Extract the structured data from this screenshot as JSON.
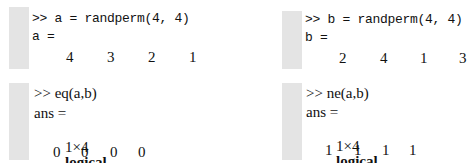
{
  "panels": {
    "a": {
      "command": ">> a = randperm(4, 4)",
      "var_label": "a =",
      "values": [
        "4",
        "3",
        "2",
        "1"
      ]
    },
    "b": {
      "command": ">> b = randperm(4, 4)",
      "var_label": "b =",
      "values": [
        "2",
        "4",
        "1",
        "3"
      ]
    },
    "eq": {
      "command": ">> eq(a,b)",
      "var_label": "ans =",
      "size": "1×4",
      "type": "logical",
      "kind": "array",
      "values": [
        "0",
        "0",
        "0",
        "0"
      ]
    },
    "ne": {
      "command": ">> ne(a,b)",
      "var_label": "ans =",
      "size": "1×4",
      "type": "logical",
      "kind": "array",
      "values": [
        "1",
        "1",
        "1",
        "1"
      ]
    }
  },
  "colors": {
    "gutter": "#e4e4e4",
    "text": "#111111",
    "background": "#ffffff"
  }
}
